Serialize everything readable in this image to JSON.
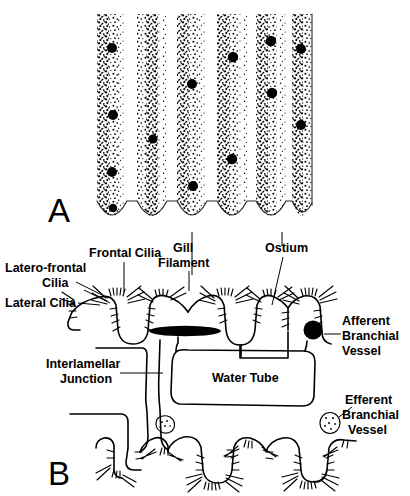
{
  "figure": {
    "panels": [
      {
        "id": "A",
        "letter": "A",
        "description": "stippled frontal view of gill filaments with ostia"
      },
      {
        "id": "B",
        "letter": "B",
        "description": "cross-section through gill lamellae showing water tube"
      }
    ]
  },
  "labels": {
    "frontal_cilia": "Frontal Cilia",
    "latero_frontal_cilia_line1": "Latero-frontal",
    "latero_frontal_cilia_line2": "Cilia",
    "lateral_cilia": "Lateral Cilia",
    "gill_filament_line1": "Gill",
    "gill_filament_line2": "Filament",
    "ostium": "Ostium",
    "afferent_line1": "Afferent",
    "afferent_line2": "Branchial",
    "afferent_line3": "Vessel",
    "efferent_line1": "Efferent",
    "efferent_line2": "Branchial",
    "efferent_line3": "Vessel",
    "interlamellar_line1": "Interlamellar",
    "interlamellar_line2": "Junction",
    "water_tube": "Water Tube"
  },
  "panel_a": {
    "bounds": {
      "x": 96,
      "y": 12,
      "width": 216,
      "height": 218
    },
    "filament_count": 6,
    "filament_width": 30,
    "ostia_dots": [
      {
        "filament": 1,
        "x": 112,
        "y": 48,
        "r": 5.0
      },
      {
        "filament": 1,
        "x": 113,
        "y": 115,
        "r": 5.0
      },
      {
        "filament": 1,
        "x": 112,
        "y": 172,
        "r": 5.0
      },
      {
        "filament": 1,
        "x": 113,
        "y": 208,
        "r": 4.2
      },
      {
        "filament": 2,
        "x": 153,
        "y": 139,
        "r": 4.6
      },
      {
        "filament": 3,
        "x": 192,
        "y": 84,
        "r": 5.0
      },
      {
        "filament": 3,
        "x": 193,
        "y": 186,
        "r": 5.0
      },
      {
        "filament": 4,
        "x": 233,
        "y": 57,
        "r": 5.2
      },
      {
        "filament": 4,
        "x": 232,
        "y": 159,
        "r": 5.2
      },
      {
        "filament": 5,
        "x": 271,
        "y": 41,
        "r": 5.2
      },
      {
        "filament": 5,
        "x": 272,
        "y": 93,
        "r": 5.2
      },
      {
        "filament": 6,
        "x": 301,
        "y": 49,
        "r": 5.0
      },
      {
        "filament": 6,
        "x": 301,
        "y": 125,
        "r": 5.0
      }
    ]
  },
  "panel_b": {
    "upper_filaments": 5,
    "lower_filaments": 5,
    "afferent_vessel": {
      "x": 313,
      "y": 330,
      "r": 9.5,
      "style": "filled-black"
    },
    "efferent_vessel": {
      "x": 330,
      "y": 423,
      "r": 9.5,
      "style": "stippled-outline"
    },
    "dark_lens": {
      "cx": 185,
      "cy": 331,
      "rx": 36,
      "ry": 5
    },
    "small_stipple_node": {
      "x": 165,
      "y": 425,
      "r": 8
    }
  },
  "colors": {
    "ink": "#000000",
    "background": "#ffffff"
  }
}
